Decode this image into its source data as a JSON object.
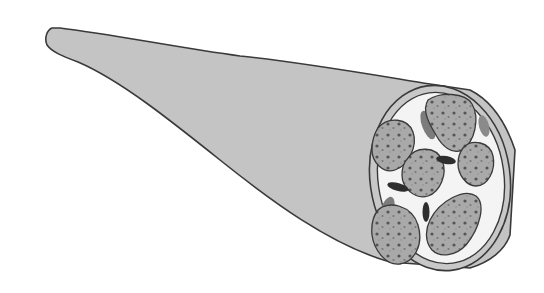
{
  "figure": {
    "colors": {
      "background": "#ffffff",
      "sheath_fill": "#c4c4c4",
      "outline": "#3a3a3a",
      "interior": "#f4f4f4",
      "fascicle_fill": "#a9a9a9",
      "dot_dark": "#555555",
      "dot_light": "#8a8a8a",
      "vessel_fill": "#7c7c7c",
      "bead_fill": "#2e2e2e"
    },
    "components": [
      {
        "id": "outer-sheath",
        "label": "Outer sheath"
      },
      {
        "id": "cross-section",
        "label": "Cross-section"
      },
      {
        "id": "fascicle",
        "label": "Fascicle",
        "count": 6
      },
      {
        "id": "vessel",
        "label": "Blood vessel",
        "count": 3
      },
      {
        "id": "beaded-strand",
        "label": "Beaded strand",
        "count": 3
      }
    ]
  }
}
